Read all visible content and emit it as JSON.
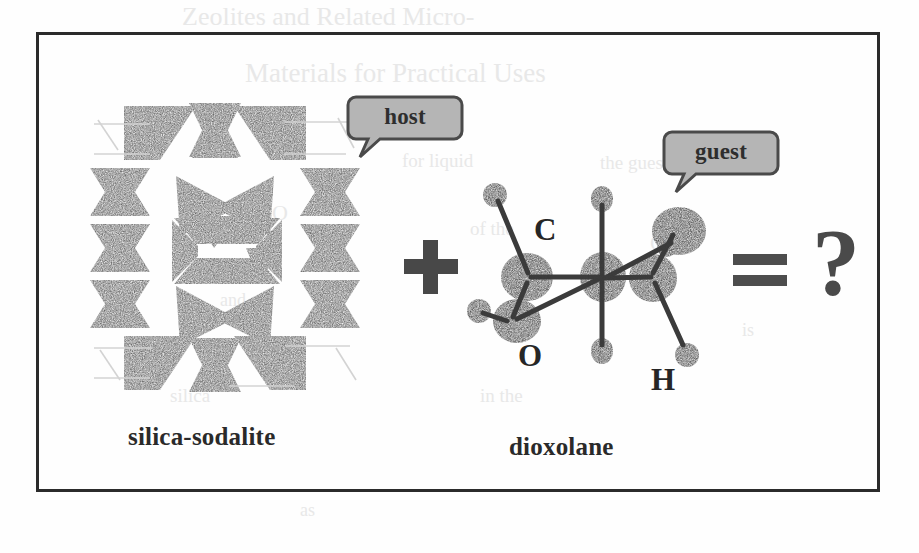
{
  "figure": {
    "kind": "scanned-chemistry-scheme",
    "caption_host": "silica-sodalite",
    "caption_guest": "dioxolane",
    "operator_plus": "+",
    "operator_equals": "=",
    "operator_question": "?",
    "frame_color": "#2b2b2b",
    "background_color": "#fefefe"
  },
  "callouts": {
    "host": {
      "label": "host",
      "fill_color": "#b5b5b5",
      "border_color": "#4a4a4a",
      "text_color": "#2e2e2e"
    },
    "guest": {
      "label": "guest",
      "fill_color": "#b5b5b5",
      "border_color": "#4a4a4a",
      "text_color": "#2e2e2e"
    }
  },
  "host_structure": {
    "name": "silica-sodalite",
    "depiction": "polyhedral tetrahedra framework, bowtie tessellation with central square window",
    "polyhedron_fill": "#565656",
    "void_fill": "#ffffff"
  },
  "guest_molecule": {
    "name": "dioxolane",
    "depiction": "ball-and-stick model",
    "atom_labels": [
      {
        "element": "C",
        "label": "C"
      },
      {
        "element": "O",
        "label": "O"
      },
      {
        "element": "H",
        "label": "H"
      }
    ],
    "atom_color": "#3b3b3b",
    "bond_color": "#3b3b3b"
  },
  "scan_ghosts": [
    {
      "text": "Zeolites and Related Micro-",
      "x": 182,
      "y": 2,
      "size": 26
    },
    {
      "text": "Materials for Practical Uses",
      "x": 245,
      "y": 58,
      "size": 27
    },
    {
      "text": "for liquid",
      "x": 402,
      "y": 150,
      "size": 19
    },
    {
      "text": "O",
      "x": 272,
      "y": 200,
      "size": 22
    },
    {
      "text": "of the",
      "x": 470,
      "y": 218,
      "size": 19
    },
    {
      "text": "the guest",
      "x": 600,
      "y": 152,
      "size": 19
    },
    {
      "text": "O",
      "x": 650,
      "y": 230,
      "size": 22
    },
    {
      "text": "and",
      "x": 220,
      "y": 290,
      "size": 18
    },
    {
      "text": "is",
      "x": 742,
      "y": 320,
      "size": 18
    },
    {
      "text": "silica",
      "x": 170,
      "y": 385,
      "size": 19
    },
    {
      "text": "in the",
      "x": 480,
      "y": 385,
      "size": 19
    },
    {
      "text": "as",
      "x": 300,
      "y": 500,
      "size": 18
    }
  ]
}
